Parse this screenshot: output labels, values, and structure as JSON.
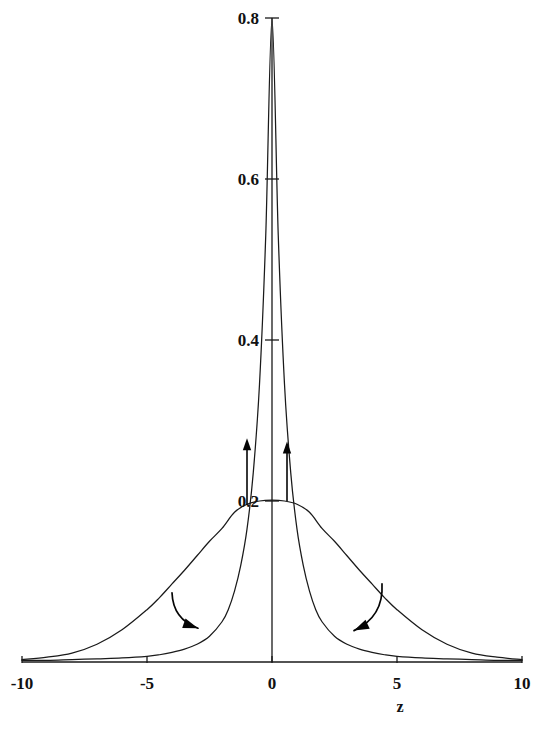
{
  "chart_data": {
    "type": "line",
    "title": "",
    "subtitle": "",
    "xlabel": "z",
    "ylabel": "",
    "xlim": [
      -10,
      10
    ],
    "ylim": [
      0,
      0.8
    ],
    "grid": false,
    "legend": null,
    "xticks": [
      -10,
      -5,
      0,
      5,
      10
    ],
    "xticklabels": [
      "-10",
      "-5",
      "0",
      "5",
      "10"
    ],
    "yticks": [
      0.2,
      0.4,
      0.6,
      0.8
    ],
    "yticklabels": [
      "0.2",
      "0.4",
      "0.6",
      "0.8"
    ],
    "series": [
      {
        "name": "narrow-peaked-density",
        "peak_value": 0.8,
        "peak_x": 0,
        "x": [
          -10,
          -9,
          -8,
          -7,
          -6,
          -5,
          -4.5,
          -4,
          -3.5,
          -3,
          -2.5,
          -2,
          -1.75,
          -1.5,
          -1.25,
          -1,
          -0.75,
          -0.5,
          -0.25,
          0,
          0.25,
          0.5,
          0.75,
          1,
          1.25,
          1.5,
          1.75,
          2,
          2.5,
          3,
          3.5,
          4,
          4.5,
          5,
          6,
          7,
          8,
          9,
          10
        ],
        "y": [
          0.002,
          0.002,
          0.003,
          0.004,
          0.005,
          0.007,
          0.009,
          0.012,
          0.016,
          0.022,
          0.032,
          0.05,
          0.065,
          0.088,
          0.12,
          0.165,
          0.235,
          0.345,
          0.53,
          0.8,
          0.53,
          0.345,
          0.235,
          0.165,
          0.12,
          0.088,
          0.065,
          0.05,
          0.032,
          0.022,
          0.016,
          0.012,
          0.009,
          0.007,
          0.005,
          0.004,
          0.003,
          0.002,
          0.002
        ]
      },
      {
        "name": "wide-flat-density",
        "peak_value": 0.2,
        "peak_x": 0,
        "x": [
          -10,
          -9,
          -8,
          -7,
          -6,
          -5,
          -4.5,
          -4,
          -3.5,
          -3,
          -2.5,
          -2,
          -1.5,
          -1,
          -0.5,
          0,
          0.5,
          1,
          1.5,
          2,
          2.5,
          3,
          3.5,
          4,
          4.5,
          5,
          6,
          7,
          8,
          9,
          10
        ],
        "y": [
          0.003,
          0.006,
          0.011,
          0.022,
          0.04,
          0.065,
          0.08,
          0.097,
          0.114,
          0.132,
          0.15,
          0.166,
          0.186,
          0.196,
          0.2,
          0.201,
          0.2,
          0.196,
          0.186,
          0.166,
          0.15,
          0.132,
          0.114,
          0.097,
          0.08,
          0.065,
          0.04,
          0.022,
          0.011,
          0.006,
          0.003
        ]
      }
    ],
    "annotations": [
      {
        "name": "up-arrow-left",
        "kind": "straight-arrow",
        "from_x": -1.0,
        "from_y": 0.195,
        "to_x": -1.0,
        "to_y": 0.278
      },
      {
        "name": "up-arrow-right",
        "kind": "straight-arrow",
        "from_x": 0.6,
        "from_y": 0.2,
        "to_x": 0.6,
        "to_y": 0.274
      },
      {
        "name": "curved-arrow-left",
        "kind": "curved-arrow",
        "from_x": -4.0,
        "from_y": 0.086,
        "to_x": -2.96,
        "to_y": 0.042
      },
      {
        "name": "curved-arrow-right",
        "kind": "curved-arrow",
        "from_x": 4.4,
        "from_y": 0.097,
        "to_x": 3.28,
        "to_y": 0.039
      }
    ]
  },
  "style": {
    "curve_color": "#1a1a1a",
    "axis_color": "#1a1a1a",
    "arrow_color": "#050505",
    "background": "#ffffff"
  }
}
